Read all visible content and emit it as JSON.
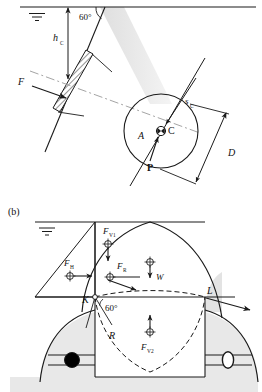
{
  "figure": {
    "panels": [
      {
        "id": "a",
        "label": "",
        "angle_label": "60°",
        "labels": {
          "depth": "h",
          "depth_sub": "C",
          "force": "F",
          "slant": "s",
          "slant_sub": "C",
          "diameter": "D",
          "area": "A",
          "centroid": "C",
          "pressure_center": "P"
        }
      },
      {
        "id": "b",
        "label": "(b)",
        "angle_label": "60°",
        "labels": {
          "vertical_force_1": "F",
          "vertical_force_1_sub": "V1",
          "horizontal_force": "F",
          "horizontal_force_sub": "H",
          "resultant_force": "F",
          "resultant_force_sub": "R",
          "weight": "W",
          "vertical_force_2": "F",
          "vertical_force_2_sub": "V2",
          "radius": "R",
          "point_k": "K",
          "point_l": "L"
        }
      }
    ],
    "colors": {
      "line": "#1a1a1a",
      "shade_light": "#e8e8e8",
      "shade_mid": "#d8d8d8",
      "hatch": "#2a2a2a",
      "dash_axis": "#9a9a9a",
      "white": "#ffffff",
      "black_fill": "#000000"
    }
  }
}
